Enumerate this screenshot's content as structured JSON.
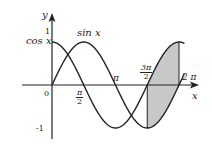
{
  "chart_data": {
    "type": "line",
    "title": "",
    "xlabel": "x",
    "ylabel": "y",
    "xlim": [
      0,
      6.4
    ],
    "ylim": [
      -1,
      1
    ],
    "x_ticks": [
      "0",
      "π/2",
      "π",
      "3π/2",
      "2π"
    ],
    "y_ticks": [
      "1",
      "-1"
    ],
    "series": [
      {
        "name": "sin x",
        "function": "sin(x)",
        "x_range": [
          0,
          6.5
        ]
      },
      {
        "name": "cos x",
        "function": "cos(x)",
        "x_range": [
          0,
          6.5
        ]
      }
    ],
    "shaded_region": {
      "x_from": "3π/2",
      "x_to": "2π",
      "between": [
        "sin x",
        "cos x"
      ],
      "color": "#c8c8c8"
    },
    "grid": false,
    "legend": "inline curve labels"
  },
  "labels": {
    "y_axis": "y",
    "x_axis": "x",
    "origin": "0",
    "y_one": "1",
    "y_neg_one": "-1",
    "cos_label": "cos x",
    "sin_label": "sin x",
    "pi": "π",
    "two_pi": "2 π",
    "half_pi_num": "π",
    "half_pi_den": "2",
    "three_half_pi_num": "3π",
    "three_half_pi_den": "2"
  },
  "colors": {
    "curve": "#222222",
    "shade": "#c8c8c8",
    "axis": "#222222"
  }
}
